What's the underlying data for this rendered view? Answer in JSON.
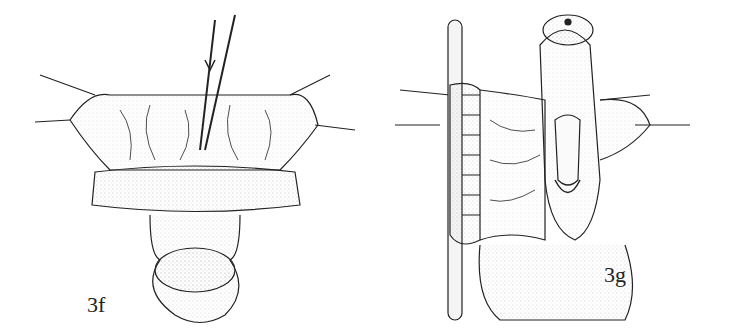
{
  "figures": [
    {
      "id": "fig-3f",
      "label": "3f"
    },
    {
      "id": "fig-3g",
      "label": "3g"
    }
  ],
  "colors": {
    "ink": "#222222",
    "background": "#ffffff"
  }
}
